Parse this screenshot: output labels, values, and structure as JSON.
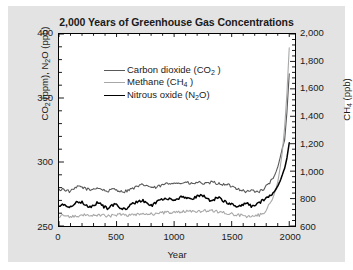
{
  "figure": {
    "background_color": "#e3e3e3",
    "plot_background_color": "#ffffff",
    "frame_color": "#000000"
  },
  "title": "2,000 Years of Greenhouse Gas Concentrations",
  "axis_x_title": "Year",
  "legend": {
    "items": [
      {
        "label_main": "Carbon dioxide (CO",
        "sub": "2",
        "label_tail": " )",
        "color": "#595959"
      },
      {
        "label_main": "Methane (CH",
        "sub": "4",
        "label_tail": " )",
        "color": "#a8a8a8"
      },
      {
        "label_main": "Nitrous oxide (N",
        "sub": "2",
        "label_tail": "O)",
        "color": "#000000"
      }
    ]
  },
  "axes": {
    "left": {
      "title_main": "CO",
      "title_sub1": "2",
      "title_mid": " (ppm), N",
      "title_sub2": "2",
      "title_tail": "O (ppb)",
      "ticks": [
        "250",
        "300",
        "350",
        "400"
      ],
      "tick_values": [
        250,
        300,
        350,
        400
      ],
      "minor_step": 10,
      "range": [
        250,
        400
      ]
    },
    "right": {
      "title_main": "CH",
      "title_sub": "4",
      "title_tail": " (ppb)",
      "ticks": [
        "600",
        "800",
        "1,000",
        "1,200",
        "1,400",
        "1,600",
        "1,800",
        "2,000"
      ],
      "tick_values": [
        600,
        800,
        1000,
        1200,
        1400,
        1600,
        1800,
        2000
      ],
      "minor_step": 40,
      "range": [
        600,
        2000
      ]
    },
    "x": {
      "ticks": [
        "0",
        "500",
        "1000",
        "1500",
        "2000"
      ],
      "tick_values": [
        0,
        500,
        1000,
        1500,
        2000
      ],
      "minor_step": 100,
      "range": [
        0,
        2050
      ]
    }
  },
  "chart_data": {
    "type": "line",
    "title": "2,000 Years of Greenhouse Gas Concentrations",
    "xlabel": "Year",
    "ylabel": "CO2 (ppm), N2O (ppb)",
    "ylabel_right": "CH4 (ppb)",
    "xlim": [
      0,
      2050
    ],
    "ylim": [
      250,
      400
    ],
    "ylim_right": [
      600,
      2000
    ],
    "grid": false,
    "legend_position": "upper-left-inside",
    "series": [
      {
        "name": "Carbon dioxide (CO2)",
        "units": "ppm",
        "axis": "left",
        "color": "#595959",
        "x": [
          0,
          30,
          60,
          90,
          120,
          150,
          180,
          210,
          240,
          270,
          300,
          330,
          360,
          390,
          420,
          450,
          480,
          510,
          540,
          570,
          600,
          630,
          660,
          690,
          720,
          750,
          780,
          810,
          840,
          870,
          900,
          930,
          960,
          990,
          1020,
          1050,
          1080,
          1110,
          1140,
          1170,
          1200,
          1230,
          1260,
          1290,
          1320,
          1350,
          1380,
          1410,
          1440,
          1470,
          1500,
          1530,
          1560,
          1590,
          1620,
          1650,
          1680,
          1710,
          1740,
          1770,
          1800,
          1830,
          1860,
          1880,
          1900,
          1920,
          1940,
          1960,
          1980,
          2000
        ],
        "y": [
          278,
          279,
          278,
          277,
          278,
          280,
          281,
          280,
          279,
          278,
          279,
          280,
          279,
          278,
          277,
          278,
          279,
          278,
          277,
          277,
          278,
          279,
          280,
          281,
          282,
          282,
          281,
          280,
          280,
          281,
          282,
          283,
          283,
          284,
          284,
          283,
          284,
          284,
          283,
          283,
          284,
          284,
          283,
          283,
          284,
          284,
          283,
          283,
          282,
          282,
          281,
          280,
          279,
          278,
          277,
          277,
          278,
          277,
          277,
          278,
          281,
          284,
          287,
          291,
          296,
          303,
          311,
          317,
          339,
          369
        ]
      },
      {
        "name": "Methane (CH4)",
        "units": "ppb",
        "axis": "right",
        "color": "#a8a8a8",
        "x": [
          0,
          30,
          60,
          90,
          120,
          150,
          180,
          210,
          240,
          270,
          300,
          330,
          360,
          390,
          420,
          450,
          480,
          510,
          540,
          570,
          600,
          630,
          660,
          690,
          720,
          750,
          780,
          810,
          840,
          870,
          900,
          930,
          960,
          990,
          1020,
          1050,
          1080,
          1110,
          1140,
          1170,
          1200,
          1230,
          1260,
          1290,
          1320,
          1350,
          1380,
          1410,
          1440,
          1470,
          1500,
          1530,
          1560,
          1590,
          1620,
          1650,
          1680,
          1710,
          1740,
          1770,
          1800,
          1830,
          1860,
          1880,
          1900,
          1920,
          1940,
          1960,
          1980,
          2000
        ],
        "y": [
          672,
          678,
          676,
          670,
          668,
          672,
          678,
          682,
          680,
          676,
          674,
          678,
          680,
          676,
          672,
          674,
          678,
          682,
          686,
          684,
          680,
          678,
          682,
          688,
          692,
          694,
          690,
          686,
          688,
          692,
          696,
          700,
          702,
          700,
          698,
          700,
          704,
          708,
          710,
          708,
          706,
          708,
          712,
          714,
          712,
          708,
          704,
          700,
          696,
          692,
          688,
          684,
          680,
          676,
          672,
          668,
          672,
          676,
          680,
          690,
          720,
          760,
          810,
          860,
          920,
          1020,
          1140,
          1320,
          1570,
          1900
        ]
      },
      {
        "name": "Nitrous oxide (N2O)",
        "units": "ppb",
        "axis": "left",
        "color": "#000000",
        "x": [
          0,
          30,
          60,
          90,
          120,
          150,
          180,
          210,
          240,
          270,
          300,
          330,
          360,
          390,
          420,
          450,
          480,
          510,
          540,
          570,
          600,
          630,
          660,
          690,
          720,
          750,
          780,
          810,
          840,
          870,
          900,
          930,
          960,
          990,
          1020,
          1050,
          1080,
          1110,
          1140,
          1170,
          1200,
          1230,
          1260,
          1290,
          1320,
          1350,
          1380,
          1410,
          1440,
          1470,
          1500,
          1530,
          1560,
          1590,
          1620,
          1650,
          1680,
          1710,
          1740,
          1770,
          1800,
          1830,
          1860,
          1880,
          1900,
          1920,
          1940,
          1960,
          1980,
          2000
        ],
        "y": [
          266,
          267,
          266,
          265,
          266,
          268,
          269,
          268,
          266,
          265,
          266,
          268,
          267,
          265,
          264,
          265,
          267,
          266,
          264,
          263,
          265,
          267,
          268,
          269,
          270,
          269,
          267,
          266,
          268,
          270,
          271,
          272,
          271,
          270,
          271,
          272,
          273,
          272,
          271,
          272,
          273,
          274,
          273,
          271,
          270,
          271,
          272,
          271,
          269,
          268,
          267,
          266,
          265,
          266,
          268,
          267,
          265,
          266,
          268,
          270,
          272,
          274,
          276,
          278,
          281,
          285,
          290,
          295,
          303,
          315
        ]
      }
    ]
  }
}
